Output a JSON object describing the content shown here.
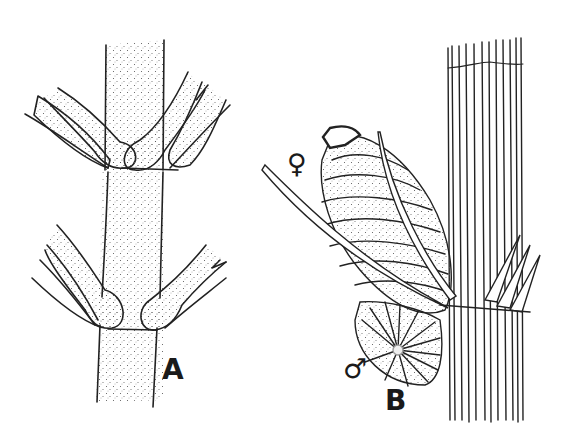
{
  "figure": {
    "panels": [
      {
        "id": "A",
        "label": "A",
        "subject": "stem with whorled branches at two nodes"
      },
      {
        "id": "B",
        "label": "B",
        "subject": "ribbed stem with node bearing female and male organs"
      }
    ],
    "symbols": {
      "female": "♀",
      "male": "♂"
    }
  }
}
